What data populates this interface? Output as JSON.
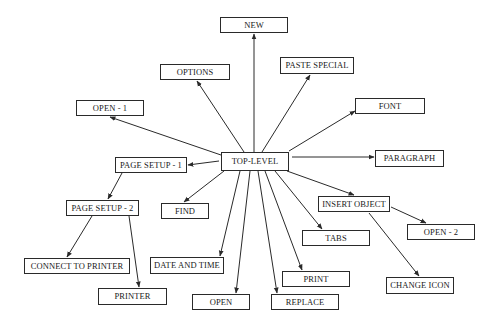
{
  "diagram": {
    "type": "menu-hierarchy",
    "root": "top-level",
    "nodes": [
      {
        "id": "new",
        "label": "NEW",
        "x": 220,
        "y": 17,
        "w": 68,
        "h": 16
      },
      {
        "id": "options",
        "label": "OPTIONS",
        "x": 160,
        "y": 64,
        "w": 70,
        "h": 16
      },
      {
        "id": "paste-special",
        "label": "PASTE SPECIAL",
        "x": 280,
        "y": 57,
        "w": 74,
        "h": 17
      },
      {
        "id": "open-1",
        "label": "OPEN - 1",
        "x": 76,
        "y": 100,
        "w": 68,
        "h": 16
      },
      {
        "id": "font",
        "label": "FONT",
        "x": 355,
        "y": 98,
        "w": 70,
        "h": 16
      },
      {
        "id": "top-level",
        "label": "TOP-LEVEL",
        "x": 221,
        "y": 152,
        "w": 68,
        "h": 19
      },
      {
        "id": "page-setup-1",
        "label": "PAGE SETUP - 1",
        "x": 115,
        "y": 157,
        "w": 72,
        "h": 16
      },
      {
        "id": "paragraph",
        "label": "PARAGRAPH",
        "x": 375,
        "y": 150,
        "w": 69,
        "h": 17
      },
      {
        "id": "page-setup-2",
        "label": "PAGE SETUP - 2",
        "x": 66,
        "y": 200,
        "w": 73,
        "h": 16
      },
      {
        "id": "find",
        "label": "FIND",
        "x": 161,
        "y": 203,
        "w": 48,
        "h": 16
      },
      {
        "id": "insert-object",
        "label": "INSERT OBJECT",
        "x": 318,
        "y": 196,
        "w": 72,
        "h": 16
      },
      {
        "id": "open-2",
        "label": "OPEN - 2",
        "x": 407,
        "y": 224,
        "w": 68,
        "h": 16
      },
      {
        "id": "tabs",
        "label": "TABS",
        "x": 302,
        "y": 230,
        "w": 68,
        "h": 16
      },
      {
        "id": "connect-to-printer",
        "label": "CONNECT TO PRINTER",
        "x": 24,
        "y": 258,
        "w": 106,
        "h": 16
      },
      {
        "id": "date-and-time",
        "label": "DATE AND TIME",
        "x": 150,
        "y": 257,
        "w": 74,
        "h": 17
      },
      {
        "id": "print",
        "label": "PRINT",
        "x": 282,
        "y": 271,
        "w": 68,
        "h": 16
      },
      {
        "id": "change-icon",
        "label": "CHANGE ICON",
        "x": 386,
        "y": 277,
        "w": 68,
        "h": 17
      },
      {
        "id": "printer",
        "label": "PRINTER",
        "x": 98,
        "y": 288,
        "w": 69,
        "h": 17
      },
      {
        "id": "open",
        "label": "OPEN",
        "x": 192,
        "y": 294,
        "w": 58,
        "h": 16
      },
      {
        "id": "replace",
        "label": "REPLACE",
        "x": 271,
        "y": 294,
        "w": 68,
        "h": 16
      }
    ],
    "edges": [
      {
        "from": "top-level",
        "to": "new",
        "x1": 254,
        "y1": 152,
        "x2": 254,
        "y2": 34
      },
      {
        "from": "top-level",
        "to": "options",
        "x1": 244,
        "y1": 152,
        "x2": 197,
        "y2": 81
      },
      {
        "from": "top-level",
        "to": "paste-special",
        "x1": 262,
        "y1": 152,
        "x2": 310,
        "y2": 75
      },
      {
        "from": "top-level",
        "to": "open-1",
        "x1": 221,
        "y1": 155,
        "x2": 110,
        "y2": 117
      },
      {
        "from": "top-level",
        "to": "font",
        "x1": 289,
        "y1": 151,
        "x2": 355,
        "y2": 111
      },
      {
        "from": "top-level",
        "to": "page-setup-1",
        "x1": 219,
        "y1": 161,
        "x2": 188,
        "y2": 165
      },
      {
        "from": "top-level",
        "to": "paragraph",
        "x1": 292,
        "y1": 157,
        "x2": 374,
        "y2": 157
      },
      {
        "from": "top-level",
        "to": "find",
        "x1": 224,
        "y1": 171,
        "x2": 184,
        "y2": 202
      },
      {
        "from": "top-level",
        "to": "insert-object",
        "x1": 287,
        "y1": 171,
        "x2": 354,
        "y2": 195
      },
      {
        "from": "top-level",
        "to": "tabs",
        "x1": 275,
        "y1": 171,
        "x2": 322,
        "y2": 229
      },
      {
        "from": "top-level",
        "to": "print",
        "x1": 265,
        "y1": 171,
        "x2": 302,
        "y2": 270
      },
      {
        "from": "top-level",
        "to": "replace",
        "x1": 258,
        "y1": 171,
        "x2": 277,
        "y2": 293
      },
      {
        "from": "top-level",
        "to": "open",
        "x1": 250,
        "y1": 171,
        "x2": 236,
        "y2": 293
      },
      {
        "from": "top-level",
        "to": "date-and-time",
        "x1": 240,
        "y1": 171,
        "x2": 220,
        "y2": 256
      },
      {
        "from": "page-setup-1",
        "to": "page-setup-2",
        "x1": 122,
        "y1": 173,
        "x2": 108,
        "y2": 199
      },
      {
        "from": "page-setup-2",
        "to": "connect-to-printer",
        "x1": 92,
        "y1": 216,
        "x2": 67,
        "y2": 257
      },
      {
        "from": "page-setup-2",
        "to": "printer",
        "x1": 129,
        "y1": 216,
        "x2": 139,
        "y2": 287
      },
      {
        "from": "insert-object",
        "to": "open-2",
        "x1": 391,
        "y1": 207,
        "x2": 426,
        "y2": 223
      },
      {
        "from": "insert-object",
        "to": "change-icon",
        "x1": 369,
        "y1": 213,
        "x2": 419,
        "y2": 276
      }
    ],
    "colors": {
      "stroke": "#2a2a2a",
      "text": "#1a1a1a",
      "background": "#ffffff"
    }
  }
}
